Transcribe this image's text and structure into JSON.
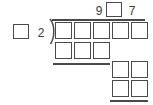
{
  "problem": {
    "type": "long-division-worksheet",
    "quotient": {
      "label": "quotient",
      "cells": [
        {
          "kind": "digit",
          "value": "9"
        },
        {
          "kind": "blank",
          "value": ""
        },
        {
          "kind": "digit",
          "value": "7"
        }
      ]
    },
    "divisor": {
      "label": "divisor",
      "cells": [
        {
          "kind": "blank",
          "value": ""
        },
        {
          "kind": "digit",
          "value": "2"
        }
      ]
    },
    "dividend": {
      "label": "dividend",
      "blank_count": 5
    },
    "partial_product_1": {
      "label": "first-partial-product",
      "blank_count": 3
    },
    "partial_product_2": {
      "label": "second-partial-product",
      "blank_count": 2
    },
    "remainder_row": {
      "label": "remainder",
      "blank_count": 2
    }
  },
  "colors": {
    "ink": "#4a4a4a",
    "text": "#3a3a3a",
    "paper": "#ffffff"
  }
}
